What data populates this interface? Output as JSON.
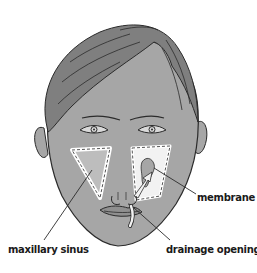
{
  "diagram": {
    "labels": {
      "membrane": "membrane",
      "maxillary_sinus": "maxillary sinus",
      "drainage_opening": "drainage opening"
    },
    "colors": {
      "skin": "#a6a6a6",
      "hair": "#7f7f7f",
      "outline": "#2b2b2b",
      "sinus_fill": "#bdbdbd",
      "sinus_border": "#ffffff",
      "background": "#ffffff",
      "label_text": "#1a1a1a"
    }
  }
}
